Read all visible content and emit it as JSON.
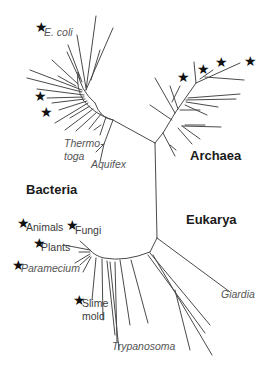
{
  "domains": [
    {
      "name": "Bacteria",
      "x": 26,
      "y": 188
    },
    {
      "name": "Archaea",
      "x": 190,
      "y": 154
    },
    {
      "name": "Eukarya",
      "x": 186,
      "y": 218
    }
  ],
  "organisms": [
    {
      "name": "E. coli",
      "italic": true,
      "starred": true,
      "x": 45,
      "y": 32
    },
    {
      "name": "Thermo-",
      "italic": true,
      "starred": false,
      "x": 64,
      "y": 143
    },
    {
      "name": "toga",
      "italic": true,
      "starred": false,
      "x": 64,
      "y": 157
    },
    {
      "name": "Aquifex",
      "italic": true,
      "starred": false,
      "x": 91,
      "y": 164
    },
    {
      "name": "Animals",
      "italic": false,
      "starred": true,
      "x": 26,
      "y": 227
    },
    {
      "name": "Fungi",
      "italic": false,
      "starred": true,
      "x": 75,
      "y": 229
    },
    {
      "name": "Plants",
      "italic": false,
      "starred": true,
      "x": 41,
      "y": 246
    },
    {
      "name": "Paramecium",
      "italic": true,
      "starred": true,
      "x": 21,
      "y": 268
    },
    {
      "name": "Slime",
      "italic": false,
      "starred": true,
      "x": 82,
      "y": 303
    },
    {
      "name": "mold",
      "italic": false,
      "starred": false,
      "x": 82,
      "y": 316
    },
    {
      "name": "Trypanosoma",
      "italic": true,
      "starred": false,
      "x": 112,
      "y": 345
    },
    {
      "name": "Giardia",
      "italic": true,
      "starred": false,
      "x": 221,
      "y": 294
    }
  ],
  "stars": [
    {
      "x": 35,
      "y": 26,
      "label": "E. coli"
    },
    {
      "x": 35,
      "y": 94,
      "label": "Bacteria lineage"
    },
    {
      "x": 40,
      "y": 110,
      "label": "Bacteria lineage"
    },
    {
      "x": 178,
      "y": 73,
      "label": "Archaea lineage"
    },
    {
      "x": 199,
      "y": 65,
      "label": "Archaea lineage"
    },
    {
      "x": 216,
      "y": 57,
      "label": "Archaea lineage"
    },
    {
      "x": 246,
      "y": 56,
      "label": "Archaea lineage"
    },
    {
      "x": 18,
      "y": 220,
      "label": "Animals"
    },
    {
      "x": 67,
      "y": 221,
      "label": "Fungi"
    },
    {
      "x": 33,
      "y": 240,
      "label": "Plants"
    },
    {
      "x": 12,
      "y": 262,
      "label": "Paramecium"
    },
    {
      "x": 73,
      "y": 297,
      "label": "Slime mold"
    }
  ],
  "star_glyph": "★",
  "colors": {
    "branch": "#4a4a4a",
    "domain_text": "#1a1a1a",
    "organism_text": "#3a3a3a",
    "italic_text": "#555555"
  }
}
